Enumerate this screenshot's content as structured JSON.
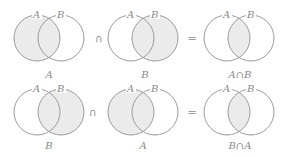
{
  "rows": [
    {
      "panels": [
        {
          "shade": "A",
          "label_a": "A",
          "label_b": "B",
          "caption": "A"
        },
        {
          "shade": "B",
          "label_a": "A",
          "label_b": "B",
          "caption": "B"
        },
        {
          "shade": "AB",
          "label_a": "A",
          "label_b": "B",
          "caption": "A∩B"
        }
      ],
      "op1": "∩",
      "op2": "="
    },
    {
      "panels": [
        {
          "shade": "B",
          "label_a": "A",
          "label_b": "B",
          "caption": "B"
        },
        {
          "shade": "A",
          "label_a": "A",
          "label_b": "B",
          "caption": "A"
        },
        {
          "shade": "AB",
          "label_a": "A",
          "label_b": "B",
          "caption": "B∩A"
        }
      ],
      "op1": "∩",
      "op2": "="
    }
  ],
  "colors": {
    "outline": "#9b9b9b",
    "shade": "#ebebeb",
    "text": "#8a8a8a"
  }
}
